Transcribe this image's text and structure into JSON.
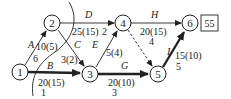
{
  "diagram": {
    "type": "activity-on-arrow network",
    "nodes": [
      {
        "id": "1",
        "label": "1"
      },
      {
        "id": "2",
        "label": "2"
      },
      {
        "id": "3",
        "label": "3"
      },
      {
        "id": "4",
        "label": "4"
      },
      {
        "id": "5",
        "label": "5"
      },
      {
        "id": "6",
        "label": "6"
      }
    ],
    "edges": [
      {
        "from": "1",
        "to": "2",
        "name": "A",
        "cost": "10(5)",
        "time": "6",
        "critical": false
      },
      {
        "from": "1",
        "to": "3",
        "name": "B",
        "cost": "20(15)",
        "time": "1",
        "critical": true
      },
      {
        "from": "2",
        "to": "3",
        "name": "C",
        "cost": "3(2)",
        "time": "",
        "critical": false
      },
      {
        "from": "2",
        "to": "4",
        "name": "D",
        "cost": "25(15)",
        "time": "2",
        "critical": false
      },
      {
        "from": "3",
        "to": "4",
        "name": "E",
        "cost": "5(4)",
        "time": "",
        "critical": false
      },
      {
        "from": "3",
        "to": "5",
        "name": "G",
        "cost": "20(10)",
        "time": "3",
        "critical": true
      },
      {
        "from": "4",
        "to": "6",
        "name": "H",
        "cost": "20(15)",
        "time": "4",
        "critical": false
      },
      {
        "from": "4",
        "to": "5",
        "name": "",
        "cost": "",
        "time": "",
        "dummy": true,
        "critical": false
      },
      {
        "from": "5",
        "to": "6",
        "name": "I",
        "cost": "15(10)",
        "time": "5",
        "critical": true
      }
    ],
    "total_box": "55"
  }
}
